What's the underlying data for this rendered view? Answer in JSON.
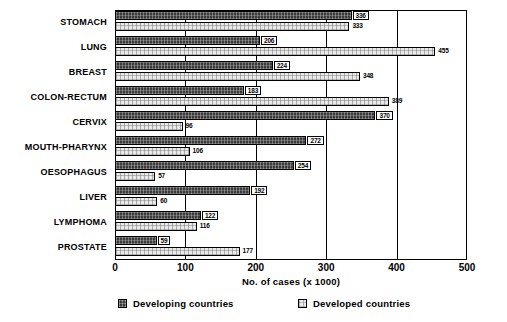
{
  "chart_data": {
    "type": "bar",
    "orientation": "horizontal",
    "title": "",
    "xlabel": "No. of cases (x 1000)",
    "ylabel": "",
    "xlim": [
      0,
      500
    ],
    "xticks": [
      0,
      100,
      200,
      300,
      400,
      500
    ],
    "xtick_labels": [
      "0",
      "100",
      "200",
      "300",
      "400",
      "500"
    ],
    "grid": true,
    "legend_position": "bottom",
    "categories": [
      "STOMACH",
      "LUNG",
      "BREAST",
      "COLON-RECTUM",
      "CERVIX",
      "MOUTH-PHARYNX",
      "OESOPHAGUS",
      "LIVER",
      "LYMPHOMA",
      "PROSTATE"
    ],
    "series": [
      {
        "name": "Developing countries",
        "color": "#3a3a3a",
        "values": [
          336,
          206,
          224,
          183,
          370,
          272,
          254,
          192,
          122,
          59
        ]
      },
      {
        "name": "Developed countries",
        "color": "#e9e9e9",
        "values": [
          333,
          455,
          348,
          389,
          96,
          106,
          57,
          60,
          116,
          177
        ]
      }
    ]
  },
  "legend": {
    "items": [
      {
        "label": "Developing countries",
        "swatch": "dark-hatched-swatch"
      },
      {
        "label": "Developed countries",
        "swatch": "light-hatched-swatch"
      }
    ]
  }
}
